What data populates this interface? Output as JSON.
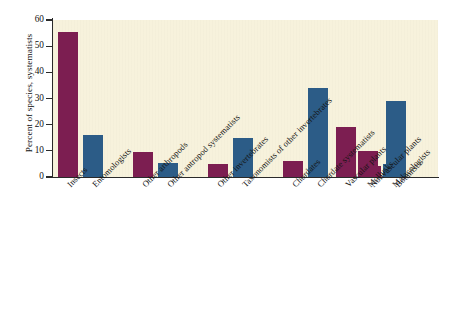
{
  "chart_data": {
    "type": "bar",
    "title": "",
    "subtitle": "",
    "xlabel": "",
    "ylabel": "Percent of species, systematists",
    "ylim": [
      0,
      60
    ],
    "yticks": [
      0,
      10,
      20,
      30,
      40,
      50,
      60
    ],
    "ytick_labels": [
      "0",
      "10",
      "20",
      "30",
      "40",
      "50",
      "60"
    ],
    "grid": false,
    "legend": null,
    "categories": [
      "Insects",
      "Entomologists",
      "Other arthropods",
      "Other antropod systematists",
      "Other invertebrates",
      "Taxonomists of other invertebrates",
      "Chordates",
      "Chordate systematists",
      "Mollusks",
      "Malacologists",
      "Vascular plants",
      "Nonvascular plants",
      "Botanists"
    ],
    "values": [
      55.3,
      16.1,
      9.5,
      5.4,
      4.8,
      15.0,
      6.0,
      34.1,
      10.0,
      4.9,
      19.1,
      4.2,
      29.2
    ],
    "bar_kinds": [
      "species",
      "taxonomy",
      "species",
      "taxonomy",
      "species",
      "taxonomy",
      "species",
      "taxonomy",
      "species",
      "taxonomy",
      "species",
      "species",
      "taxonomy"
    ],
    "colors": {
      "species": "#7c1e51",
      "taxonomy": "#2c5c87",
      "plot_background": "#f7f2dc",
      "axis": "#2a2a2a",
      "page_background": "#ffffff"
    },
    "bar_layout": [
      {
        "label": "Insects",
        "value": 55.3,
        "kind": "species",
        "left": 5,
        "width": 20
      },
      {
        "label": "Entomologists",
        "value": 16.1,
        "kind": "taxonomy",
        "left": 30,
        "width": 20
      },
      {
        "label": "Other arthropods",
        "value": 9.5,
        "kind": "species",
        "left": 80,
        "width": 20
      },
      {
        "label": "Other antropod systematists",
        "value": 5.4,
        "kind": "taxonomy",
        "left": 105,
        "width": 20
      },
      {
        "label": "Other invertebrates",
        "value": 4.8,
        "kind": "species",
        "left": 155,
        "width": 20
      },
      {
        "label": "Taxonomists of other invertebrates",
        "value": 15.0,
        "kind": "taxonomy",
        "left": 180,
        "width": 20
      },
      {
        "label": "Chordates",
        "value": 6.0,
        "kind": "species",
        "left": 230,
        "width": 20
      },
      {
        "label": "Chordate systematists",
        "value": 34.1,
        "kind": "taxonomy",
        "left": 255,
        "width": 20
      },
      {
        "label": "Mollusks",
        "value": 10.0,
        "kind": "species",
        "left": 305,
        "width": 20
      },
      {
        "label": "Malacologists",
        "value": 4.9,
        "kind": "taxonomy",
        "left": 330,
        "width": 20
      },
      {
        "label": "Vascular plants",
        "value": 19.1,
        "kind": "species",
        "left": 283,
        "width": 20
      },
      {
        "label": "Nonvascular plants",
        "value": 4.2,
        "kind": "species",
        "left": 308,
        "width": 20
      },
      {
        "label": "Botanists",
        "value": 29.2,
        "kind": "taxonomy",
        "left": 333,
        "width": 20
      }
    ]
  }
}
